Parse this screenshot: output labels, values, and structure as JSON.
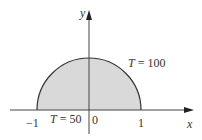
{
  "diagram": {
    "type": "semicircular-region",
    "colors": {
      "fill": "#d9d9d9",
      "stroke": "#333333",
      "axis": "#444444",
      "background": "#ffffff"
    },
    "axes": {
      "x_label": "x",
      "y_label": "y",
      "tick_labels": {
        "neg_one": "−1",
        "zero": "0",
        "one": "1"
      }
    },
    "boundary_conditions": {
      "arc": {
        "var": "T",
        "eq": " = 100"
      },
      "base": {
        "var": "T",
        "eq": " = 50"
      }
    }
  }
}
